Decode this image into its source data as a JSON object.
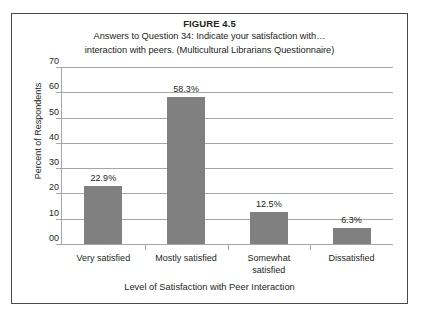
{
  "figure": {
    "number": "FIGURE 4.5",
    "caption_line1": "Answers to Question 34: Indicate your satisfaction with…",
    "caption_line2": "interaction with peers. (Multicultural Librarians Questionnaire)"
  },
  "chart_data": {
    "type": "bar",
    "title": "Answers to Question 34: Indicate your satisfaction with… interaction with peers. (Multicultural Librarians Questionnaire)",
    "categories": [
      "Very satisfied",
      "Mostly satisfied",
      "Somewhat satisfied",
      "Dissatisfied"
    ],
    "category_label_lines": [
      [
        "Very satisfied"
      ],
      [
        "Mostly satisfied"
      ],
      [
        "Somewhat",
        "satisfied"
      ],
      [
        "Dissatisfied"
      ]
    ],
    "values": [
      22.9,
      58.3,
      12.5,
      6.3
    ],
    "data_labels": [
      "22.9%",
      "58.3%",
      "12.5%",
      "6.3%"
    ],
    "xlabel": "Level of Satisfaction with Peer Interaction",
    "ylabel": "Percent of Respondents",
    "ylim": [
      0,
      70
    ],
    "ytick_values": [
      0,
      10,
      20,
      30,
      40,
      50,
      60,
      70
    ],
    "ytick_labels": [
      "00",
      "10",
      "20",
      "30",
      "40",
      "50",
      "60",
      "70"
    ],
    "grid": true,
    "legend": false,
    "bar_color": "#808080",
    "gridline_color": "#a6a6a6",
    "frame_color": "#4a4a4a",
    "background": "#ffffff"
  }
}
